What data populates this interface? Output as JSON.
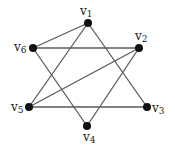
{
  "graph": {
    "nodes": [
      {
        "id": "v1",
        "label": "v",
        "sub": "1",
        "x": 88,
        "y": 23,
        "lx": 80,
        "ly": 15
      },
      {
        "id": "v2",
        "label": "v",
        "sub": "2",
        "x": 139,
        "y": 48,
        "lx": 135,
        "ly": 40
      },
      {
        "id": "v3",
        "label": "v",
        "sub": "3",
        "x": 147,
        "y": 107,
        "lx": 152,
        "ly": 112
      },
      {
        "id": "v4",
        "label": "v",
        "sub": "4",
        "x": 87,
        "y": 126,
        "lx": 83,
        "ly": 141
      },
      {
        "id": "v5",
        "label": "v",
        "sub": "5",
        "x": 29,
        "y": 107,
        "lx": 11,
        "ly": 111
      },
      {
        "id": "v6",
        "label": "v",
        "sub": "6",
        "x": 33,
        "y": 48,
        "lx": 14,
        "ly": 51
      }
    ],
    "edges": [
      [
        "v1",
        "v6"
      ],
      [
        "v1",
        "v5"
      ],
      [
        "v1",
        "v3"
      ],
      [
        "v6",
        "v2"
      ],
      [
        "v6",
        "v4"
      ],
      [
        "v2",
        "v5"
      ],
      [
        "v2",
        "v4"
      ],
      [
        "v5",
        "v3"
      ]
    ],
    "colors": {
      "edge": "#5a5a5a",
      "node": "#111111",
      "label": "#222222"
    }
  }
}
